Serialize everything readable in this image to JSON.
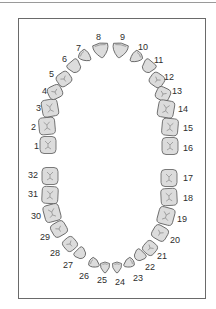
{
  "diagram": {
    "title": "",
    "type": "dental-chart",
    "numbering_system": "Universal",
    "colors": {
      "tooth_fill": "#dcdcdc",
      "tooth_outline": "#5a5a5a",
      "groove": "#8a8a8a",
      "label": "#2d2d2d",
      "frame": "#6a6a6a"
    },
    "upper_arch": {
      "teeth": [
        {
          "num": "1",
          "cx": 48,
          "cy": 145,
          "w": 16,
          "h": 17,
          "rot": 0,
          "kind": "molar",
          "lx": 34,
          "ly": 149
        },
        {
          "num": "2",
          "cx": 47,
          "cy": 126,
          "w": 16,
          "h": 17,
          "rot": -5,
          "kind": "molar",
          "lx": 31,
          "ly": 130
        },
        {
          "num": "3",
          "cx": 50,
          "cy": 108,
          "w": 16,
          "h": 17,
          "rot": -10,
          "kind": "molar",
          "lx": 36,
          "ly": 111
        },
        {
          "num": "4",
          "cx": 55,
          "cy": 92,
          "w": 14,
          "h": 13,
          "rot": -25,
          "kind": "premolar",
          "lx": 42,
          "ly": 94
        },
        {
          "num": "5",
          "cx": 64,
          "cy": 79,
          "w": 14,
          "h": 13,
          "rot": -35,
          "kind": "premolar",
          "lx": 49,
          "ly": 77
        },
        {
          "num": "6",
          "cx": 75,
          "cy": 67,
          "w": 13,
          "h": 13,
          "rot": -40,
          "kind": "canine",
          "lx": 62,
          "ly": 62
        },
        {
          "num": "7",
          "cx": 85,
          "cy": 56,
          "w": 12,
          "h": 13,
          "rot": -55,
          "kind": "incisor",
          "lx": 76,
          "ly": 51
        },
        {
          "num": "8",
          "cx": 101,
          "cy": 50,
          "w": 17,
          "h": 15,
          "rot": -10,
          "kind": "incisor",
          "lx": 96,
          "ly": 40
        },
        {
          "num": "9",
          "cx": 120,
          "cy": 50,
          "w": 17,
          "h": 15,
          "rot": 10,
          "kind": "incisor",
          "lx": 120,
          "ly": 40
        },
        {
          "num": "10",
          "cx": 136,
          "cy": 57,
          "w": 12,
          "h": 13,
          "rot": 55,
          "kind": "incisor",
          "lx": 138,
          "ly": 50
        },
        {
          "num": "11",
          "cx": 148,
          "cy": 67,
          "w": 13,
          "h": 13,
          "rot": 40,
          "kind": "canine",
          "lx": 154,
          "ly": 63
        },
        {
          "num": "12",
          "cx": 157,
          "cy": 80,
          "w": 14,
          "h": 13,
          "rot": 35,
          "kind": "premolar",
          "lx": 164,
          "ly": 80
        },
        {
          "num": "13",
          "cx": 163,
          "cy": 94,
          "w": 14,
          "h": 13,
          "rot": 25,
          "kind": "premolar",
          "lx": 172,
          "ly": 94
        },
        {
          "num": "14",
          "cx": 166,
          "cy": 109,
          "w": 16,
          "h": 17,
          "rot": 10,
          "kind": "molar",
          "lx": 178,
          "ly": 112
        },
        {
          "num": "15",
          "cx": 170,
          "cy": 127,
          "w": 16,
          "h": 17,
          "rot": 5,
          "kind": "molar",
          "lx": 183,
          "ly": 131
        },
        {
          "num": "16",
          "cx": 170,
          "cy": 146,
          "w": 16,
          "h": 17,
          "rot": 0,
          "kind": "molar",
          "lx": 183,
          "ly": 151
        }
      ]
    },
    "lower_arch": {
      "teeth": [
        {
          "num": "32",
          "cx": 50,
          "cy": 176,
          "w": 16,
          "h": 17,
          "rot": 0,
          "kind": "molar",
          "lx": 28,
          "ly": 178
        },
        {
          "num": "31",
          "cx": 50,
          "cy": 195,
          "w": 16,
          "h": 17,
          "rot": 3,
          "kind": "molar",
          "lx": 28,
          "ly": 197
        },
        {
          "num": "30",
          "cx": 52,
          "cy": 213,
          "w": 16,
          "h": 17,
          "rot": -15,
          "kind": "molar",
          "lx": 31,
          "ly": 219
        },
        {
          "num": "29",
          "cx": 59,
          "cy": 229,
          "w": 15,
          "h": 14,
          "rot": -30,
          "kind": "premolar",
          "lx": 40,
          "ly": 240
        },
        {
          "num": "28",
          "cx": 70,
          "cy": 244,
          "w": 13,
          "h": 13,
          "rot": -40,
          "kind": "premolar",
          "lx": 50,
          "ly": 256
        },
        {
          "num": "27",
          "cx": 81,
          "cy": 254,
          "w": 12,
          "h": 11,
          "rot": -45,
          "kind": "canine",
          "lx": 63,
          "ly": 268
        },
        {
          "num": "26",
          "cx": 94,
          "cy": 263,
          "w": 11,
          "h": 11,
          "rot": -60,
          "kind": "incisor",
          "lx": 79,
          "ly": 279
        },
        {
          "num": "25",
          "cx": 105,
          "cy": 267,
          "w": 11,
          "h": 11,
          "rot": 0,
          "kind": "incisor",
          "lx": 97,
          "ly": 283
        },
        {
          "num": "24",
          "cx": 117,
          "cy": 267,
          "w": 11,
          "h": 11,
          "rot": 0,
          "kind": "incisor",
          "lx": 115,
          "ly": 285
        },
        {
          "num": "23",
          "cx": 129,
          "cy": 263,
          "w": 11,
          "h": 11,
          "rot": 60,
          "kind": "incisor",
          "lx": 133,
          "ly": 281
        },
        {
          "num": "22",
          "cx": 139,
          "cy": 256,
          "w": 12,
          "h": 11,
          "rot": 45,
          "kind": "canine",
          "lx": 145,
          "ly": 270
        },
        {
          "num": "21",
          "cx": 150,
          "cy": 248,
          "w": 13,
          "h": 13,
          "rot": 40,
          "kind": "premolar",
          "lx": 157,
          "ly": 259
        },
        {
          "num": "20",
          "cx": 160,
          "cy": 233,
          "w": 15,
          "h": 14,
          "rot": 30,
          "kind": "premolar",
          "lx": 170,
          "ly": 243
        },
        {
          "num": "19",
          "cx": 166,
          "cy": 216,
          "w": 16,
          "h": 17,
          "rot": 15,
          "kind": "molar",
          "lx": 177,
          "ly": 222
        },
        {
          "num": "18",
          "cx": 169,
          "cy": 197,
          "w": 16,
          "h": 17,
          "rot": -3,
          "kind": "molar",
          "lx": 183,
          "ly": 201
        },
        {
          "num": "17",
          "cx": 169,
          "cy": 178,
          "w": 16,
          "h": 17,
          "rot": 0,
          "kind": "molar",
          "lx": 183,
          "ly": 181
        }
      ]
    }
  }
}
